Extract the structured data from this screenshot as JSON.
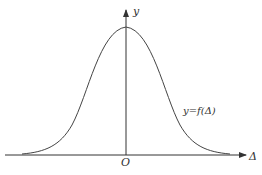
{
  "diagram": {
    "axes": {
      "y_label": "y",
      "x_label": "Δ",
      "origin_label": "O"
    },
    "curve_label": "y=f(Δ)",
    "colors": {
      "line": "#333333",
      "background": "#ffffff"
    }
  }
}
